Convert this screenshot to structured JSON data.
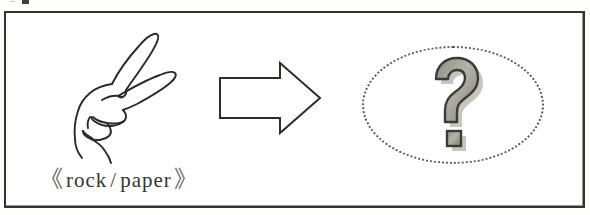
{
  "figure": {
    "kind": "scanned-diagram",
    "background_color": "#fdfdfb",
    "frame_color": "#34332d",
    "panels": [
      {
        "id": "input",
        "icon": "hand-gesture-scissors",
        "caption": {
          "open_bracket": "《",
          "text": "rock / paper",
          "left_term": "rock",
          "separator": "/",
          "right_term": "paper",
          "close_bracket": "》",
          "full": "《 rock / paper 》",
          "color": "#3a3a36"
        }
      },
      {
        "id": "transition",
        "icon": "right-arrow-outline",
        "color": "#2e2e28"
      },
      {
        "id": "output",
        "icon": "question-mark",
        "glyph": "?",
        "container": "dotted-ellipse",
        "fill_color": "#9b9b92",
        "outline_color": "#3c3c36",
        "shadow_color": "#b9b9b0",
        "ellipse_color": "#5d5d56"
      }
    ]
  }
}
